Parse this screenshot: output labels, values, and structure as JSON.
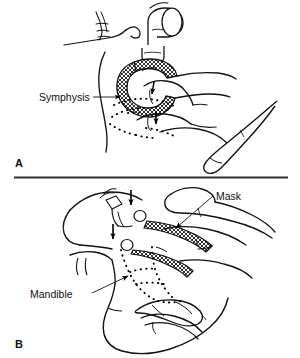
{
  "figure": {
    "type": "medical-line-illustration",
    "background_color": "#ffffff",
    "ink_color": "#000000",
    "panels": [
      {
        "id": "A",
        "letter": "A",
        "view": "superior-oblique view of head with mask and hand",
        "labels": [
          {
            "id": "symphysis",
            "text": "Symphysis",
            "leader": "horizontal line from label right edge to arrowhead on bone outline"
          }
        ],
        "annotations": {
          "arrows": 2,
          "dotted_outline": "symphysis of mandible seen through soft tissue",
          "hatched_region": "anesthesia face mask cushion and body"
        }
      },
      {
        "id": "B",
        "letter": "B",
        "view": "lateral view of head with mask and hand",
        "labels": [
          {
            "id": "mask",
            "text": "Mask",
            "leader": "diagonal line from label down-left to arrowhead on mask body"
          },
          {
            "id": "mandible",
            "text": "Mandible",
            "leader": "diagonal line from label up-right to arrowhead on dotted bone outline"
          }
        ],
        "annotations": {
          "arrows": 4,
          "dotted_outline": "body and ramus of mandible seen through soft tissue",
          "hatched_region": "anesthesia face mask cushion and body"
        }
      }
    ],
    "divider": {
      "id": "panel-divider",
      "orientation": "horizontal",
      "color": "#333333"
    }
  }
}
